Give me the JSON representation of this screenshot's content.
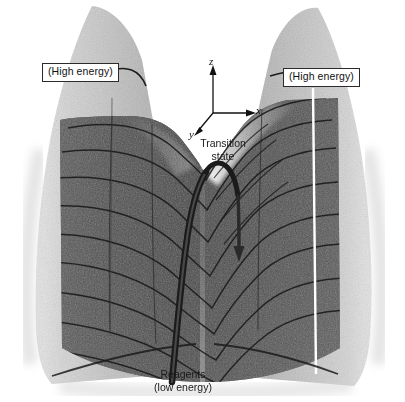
{
  "figure": {
    "background_color": "#ffffff",
    "ink_color": "#2b2b2b",
    "width": 405,
    "height": 402
  },
  "labels": {
    "high_energy_left": "(High energy)",
    "high_energy_right": "(High energy)",
    "transition_state_line1": "Transition",
    "transition_state_line2": "state",
    "reagents_line1": "Reagents",
    "reagents_line2": "(low energy)"
  },
  "axes": {
    "z": "z",
    "x": "x",
    "y": "y",
    "origin": {
      "x": 213,
      "y": 113
    },
    "z_tip": {
      "x": 213,
      "y": 68
    },
    "x_tip": {
      "x": 253,
      "y": 113
    },
    "y_tip": {
      "x": 196,
      "y": 133
    }
  },
  "icons": {
    "z_axis_arrow": "arrow-up-icon",
    "x_axis_arrow": "arrow-right-icon",
    "y_axis_arrow": "arrow-down-left-icon",
    "reaction_path_arrow": "arrow-down-icon"
  },
  "surface": {
    "left_peak_label_anchor": "left-energy-wall",
    "right_peak_label_anchor": "right-energy-wall",
    "saddle_name": "transition-state-saddle",
    "valley_name": "reagent-valley",
    "contour_line_count": 9,
    "shading": "stippled-grayscale"
  },
  "reaction_path": {
    "name": "reaction-coordinate-path",
    "description": "thick ribbon curve rising from reagents through the transition state and descending over the pass",
    "arrowhead_at": {
      "x": 239,
      "y": 258
    }
  }
}
